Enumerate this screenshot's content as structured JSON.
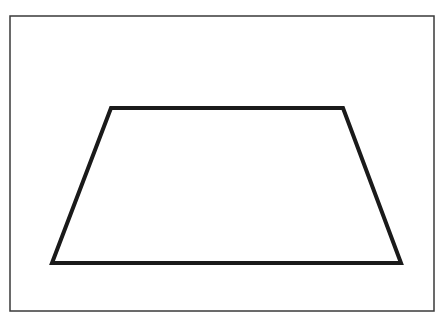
{
  "figure": {
    "background": "#ffffff",
    "frame": {
      "x": 10,
      "y": 16,
      "width": 424,
      "height": 295,
      "stroke": "#3a3a3a",
      "stroke_width": 1.5
    },
    "shape": {
      "type": "trapezoid",
      "points": [
        [
          111,
          108
        ],
        [
          343,
          108
        ],
        [
          401,
          263
        ],
        [
          52,
          263
        ]
      ],
      "stroke": "#1a1a1a",
      "stroke_width": 4,
      "fill": "none"
    }
  }
}
